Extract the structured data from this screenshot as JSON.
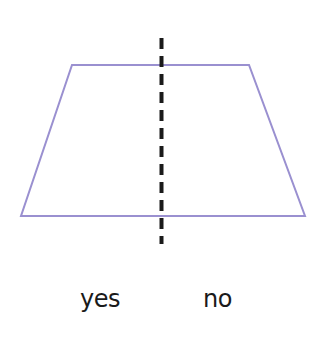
{
  "diagram": {
    "shape": "trapezoid",
    "shape_color": "#9a90d0",
    "axis_color": "#1a1a1a",
    "labels": {
      "left": "yes",
      "right": "no"
    }
  }
}
